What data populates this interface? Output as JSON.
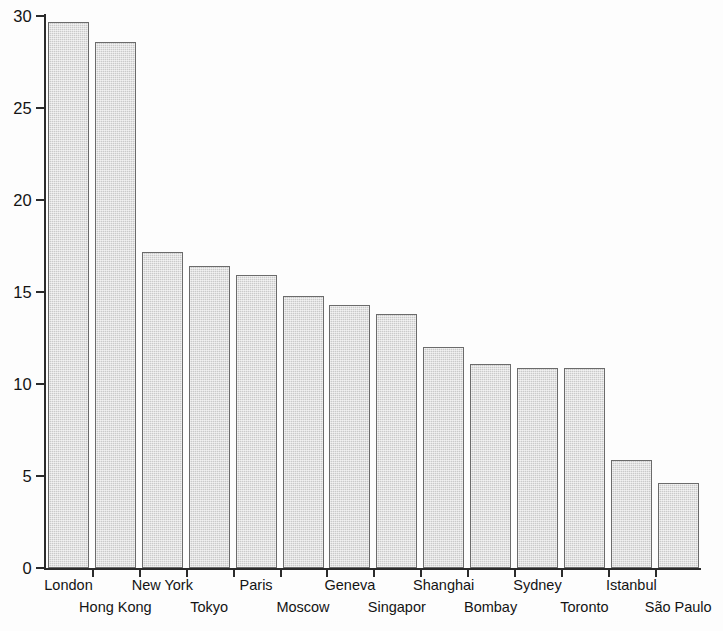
{
  "chart_data": {
    "type": "bar",
    "title": "",
    "subtitle": "",
    "xlabel": "",
    "ylabel": "",
    "categories": [
      "London",
      "Hong Kong",
      "New York",
      "Tokyo",
      "Paris",
      "Moscow",
      "Geneva",
      "Singapor",
      "Shanghai",
      "Bombay",
      "Sydney",
      "Toronto",
      "Istanbul",
      "São Paulo"
    ],
    "values": [
      29.7,
      28.6,
      17.2,
      16.4,
      15.9,
      14.8,
      14.3,
      13.8,
      12.0,
      11.1,
      10.85,
      10.85,
      5.85,
      4.6
    ],
    "ylim": [
      0,
      30
    ],
    "yticks": [
      0,
      5,
      10,
      15,
      20,
      25,
      30
    ],
    "ytick_labels": [
      "0",
      "5",
      "10",
      "15",
      "20",
      "25",
      "30"
    ],
    "grid": false,
    "legend": null,
    "bar_color": "#cacaca",
    "bar_edge_color": "#6b6b6b",
    "axis_color": "#2b2b2b",
    "background_color": "#fdfdfd",
    "label_rows": [
      "top",
      "bottom",
      "top",
      "bottom",
      "top",
      "bottom",
      "top",
      "bottom",
      "top",
      "bottom",
      "top",
      "bottom",
      "top",
      "bottom"
    ]
  }
}
